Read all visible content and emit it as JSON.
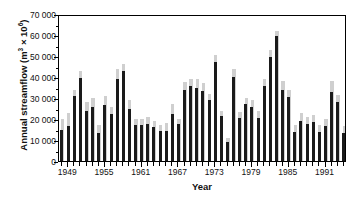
{
  "chart_data": {
    "type": "bar",
    "title": "",
    "xlabel": "Year",
    "ylabel": "Annual streamflow (m3 x 106)",
    "ylabel_prefix": "Annual streamflow (m",
    "ylabel_sup1": "3",
    "ylabel_mid": " × 10",
    "ylabel_sup2": "6",
    "ylabel_suffix": ")",
    "ylim": [
      0,
      70000
    ],
    "ytick_values": [
      0,
      10000,
      20000,
      30000,
      40000,
      50000,
      60000,
      70000
    ],
    "ytick_labels": [
      "0",
      "10 000",
      "20 000",
      "30 000",
      "40 000",
      "50 000",
      "60 000",
      "70 000"
    ],
    "xlim": [
      1948,
      1994
    ],
    "xtick_labels": [
      "1949",
      "1955",
      "1961",
      "1967",
      "1973",
      "1979",
      "1985",
      "1991"
    ],
    "xtick_positions": [
      1949,
      1955,
      1961,
      1967,
      1973,
      1979,
      1985,
      1991
    ],
    "grid": false,
    "legend": "none",
    "categories": [
      1948,
      1949,
      1950,
      1951,
      1952,
      1953,
      1954,
      1955,
      1956,
      1957,
      1958,
      1959,
      1960,
      1961,
      1962,
      1963,
      1964,
      1965,
      1966,
      1967,
      1968,
      1969,
      1970,
      1971,
      1972,
      1973,
      1974,
      1975,
      1976,
      1977,
      1978,
      1979,
      1980,
      1981,
      1982,
      1983,
      1984,
      1985,
      1986,
      1987,
      1988,
      1989,
      1990,
      1991,
      1992,
      1993,
      1994
    ],
    "series": [
      {
        "name": "observed",
        "color": "#1a1a1a",
        "values": [
          15000,
          16500,
          31000,
          39500,
          24000,
          25500,
          13500,
          26500,
          22500,
          39000,
          43000,
          25000,
          17000,
          17000,
          17500,
          16000,
          14500,
          14500,
          22500,
          17500,
          34000,
          35500,
          35000,
          33500,
          29000,
          47000,
          21500,
          9000,
          40000,
          20500,
          27000,
          25500,
          20500,
          35500,
          49500,
          59500,
          34000,
          30500,
          14000,
          19000,
          17500,
          18500,
          14000,
          16500,
          33000,
          28000,
          13500
        ],
        "max_values": [
          20000,
          23000,
          34000,
          43000,
          28000,
          30000,
          17000,
          31000,
          25500,
          44000,
          46000,
          29000,
          20000,
          20000,
          21000,
          19000,
          17000,
          18000,
          27000,
          20000,
          37500,
          39000,
          39000,
          37000,
          32000,
          50500,
          24000,
          11000,
          44000,
          23500,
          30000,
          29000,
          24000,
          39000,
          53000,
          62000,
          38000,
          34000,
          17000,
          23000,
          21000,
          22000,
          17000,
          20000,
          38000,
          31500,
          16500
        ]
      }
    ]
  }
}
